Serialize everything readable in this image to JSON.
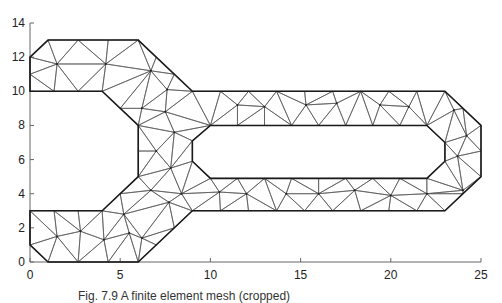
{
  "figure": {
    "type": "finite-element triangular mesh",
    "caption": "Fig. 7.9  A finite element mesh (cropped)",
    "colors": {
      "boundary": "#1a1a1a",
      "mesh": "#555555",
      "axis": "#666666",
      "background": "#ffffff"
    }
  },
  "axes": {
    "x": {
      "min": 0,
      "max": 25,
      "ticks": [
        0,
        5,
        10,
        15,
        20,
        25
      ],
      "tick_labels": [
        "0",
        "5",
        "10",
        "15",
        "20",
        "25"
      ]
    },
    "y": {
      "min": 0,
      "max": 14,
      "ticks": [
        0,
        2,
        4,
        6,
        8,
        10,
        12,
        14
      ],
      "tick_labels": [
        "0",
        "2",
        "4",
        "6",
        "8",
        "10",
        "12",
        "14"
      ]
    }
  },
  "geometry": {
    "outer_boundary": [
      [
        0,
        1
      ],
      [
        0,
        3
      ],
      [
        4,
        3
      ],
      [
        6,
        5
      ],
      [
        6,
        6.5
      ],
      [
        6,
        8
      ],
      [
        4,
        10
      ],
      [
        0,
        10
      ],
      [
        0,
        11
      ],
      [
        0,
        12
      ],
      [
        1,
        13
      ],
      [
        6,
        13
      ],
      [
        9,
        10
      ],
      [
        23,
        10
      ],
      [
        25,
        8
      ],
      [
        25,
        5
      ],
      [
        23,
        3
      ],
      [
        9,
        3
      ],
      [
        6,
        0
      ],
      [
        1,
        0
      ]
    ],
    "inner_hole": [
      [
        10,
        8
      ],
      [
        22,
        8
      ],
      [
        23,
        7
      ],
      [
        23,
        5.9
      ],
      [
        22,
        4.9
      ],
      [
        10,
        4.9
      ],
      [
        9,
        5.9
      ],
      [
        9,
        7.1
      ]
    ],
    "interior_nodes": [
      [
        1.5,
        11.6
      ],
      [
        4.2,
        11.6
      ],
      [
        6.7,
        11.2
      ],
      [
        7.6,
        10.1
      ],
      [
        6.2,
        9.0
      ],
      [
        7.5,
        8.8
      ],
      [
        8.0,
        7.6
      ],
      [
        7.0,
        6.5
      ],
      [
        7.8,
        5.5
      ],
      [
        6.7,
        4.2
      ],
      [
        7.7,
        3.5
      ],
      [
        5.2,
        2.8
      ],
      [
        4.1,
        1.3
      ],
      [
        5.5,
        1.7
      ],
      [
        6.2,
        1.4
      ],
      [
        1.5,
        1.5
      ],
      [
        2.8,
        1.8
      ],
      [
        8.4,
        4.0
      ],
      [
        11.5,
        9.2
      ],
      [
        13.0,
        9.1
      ],
      [
        15.3,
        9.2
      ],
      [
        17.0,
        9.3
      ],
      [
        19.4,
        9.2
      ],
      [
        21.0,
        9.1
      ],
      [
        23.5,
        8.9
      ],
      [
        24.2,
        7.4
      ],
      [
        23.7,
        6.2
      ],
      [
        24.0,
        4.2
      ],
      [
        22.0,
        4.0
      ],
      [
        20.0,
        3.9
      ],
      [
        18.0,
        4.2
      ],
      [
        16.0,
        4.0
      ],
      [
        14.2,
        4.0
      ],
      [
        12.0,
        4.0
      ],
      [
        10.5,
        4.1
      ]
    ]
  },
  "chart_data": {
    "type": "mesh-diagram",
    "title": "",
    "xlabel": "",
    "ylabel": "",
    "xlim": [
      0,
      25
    ],
    "ylim": [
      0,
      14
    ],
    "x_tick_labels": [
      "0",
      "5",
      "10",
      "15",
      "20",
      "25"
    ],
    "y_tick_labels": [
      "0",
      "2",
      "4",
      "6",
      "8",
      "10",
      "12",
      "14"
    ],
    "grid": false,
    "legend": null
  }
}
